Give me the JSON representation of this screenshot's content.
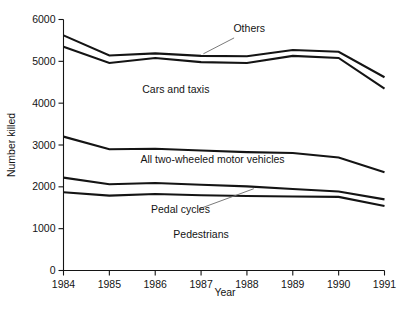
{
  "chart_data": {
    "type": "line",
    "title": "",
    "xlabel": "Year",
    "ylabel": "Number killed",
    "x": [
      1984,
      1985,
      1986,
      1987,
      1988,
      1989,
      1990,
      1991
    ],
    "xtick_labels": [
      "1984",
      "1985",
      "1986",
      "1987",
      "1988",
      "1989",
      "1990",
      "1991"
    ],
    "ytick_labels": [
      "0",
      "1000",
      "2000",
      "3000",
      "4000",
      "5000",
      "6000"
    ],
    "ytick_values": [
      0,
      1000,
      2000,
      3000,
      4000,
      5000,
      6000
    ],
    "xlim": [
      1984,
      1991
    ],
    "ylim": [
      0,
      6000
    ],
    "grid": false,
    "legend_position": "inline-annotations",
    "chart_style": "cumulative boundary lines, black, no fill",
    "series": [
      {
        "name": "Others (upper boundary / total)",
        "label": "Others",
        "values": [
          5620,
          5140,
          5190,
          5130,
          5120,
          5270,
          5230,
          4620
        ]
      },
      {
        "name": "Cars and taxis",
        "label": "Cars and taxis",
        "values": [
          5350,
          4960,
          5080,
          4980,
          4960,
          5130,
          5080,
          4350
        ]
      },
      {
        "name": "All two-wheeled motor vehicles",
        "label": "All two-wheeled motor vehicles",
        "values": [
          3200,
          2900,
          2910,
          2870,
          2830,
          2810,
          2700,
          2350
        ]
      },
      {
        "name": "Pedal cycles",
        "label": "Pedal cycles",
        "values": [
          2220,
          2060,
          2090,
          2050,
          2010,
          1950,
          1890,
          1700
        ]
      },
      {
        "name": "Pedestrians",
        "label": "Pedestrians",
        "values": [
          1870,
          1790,
          1830,
          1800,
          1780,
          1770,
          1760,
          1540
        ]
      }
    ],
    "annotations": [
      {
        "text": "Others",
        "x": 1988.05,
        "y": 5700,
        "leader": true
      },
      {
        "text": "Cars and taxis",
        "x": 1986.45,
        "y": 4250,
        "leader": false
      },
      {
        "text": "All two-wheeled motor vehicles",
        "x": 1987.25,
        "y": 2570,
        "leader": false
      },
      {
        "text": "Pedal cycles",
        "x": 1986.55,
        "y": 1370,
        "leader": true
      },
      {
        "text": "Pedestrians",
        "x": 1987.0,
        "y": 780,
        "leader": false
      }
    ],
    "colors": {
      "line": "#141414",
      "axis": "#141414",
      "background": "#ffffff",
      "leader": "#6b6b6b"
    }
  }
}
